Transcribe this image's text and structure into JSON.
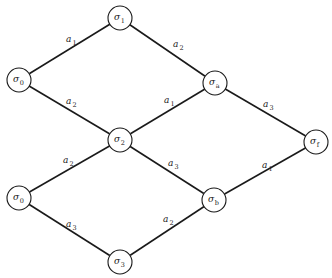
{
  "diagram": {
    "type": "state-lattice",
    "nodes": [
      {
        "id": "s1",
        "base": "σ",
        "sub": "1"
      },
      {
        "id": "s0a",
        "base": "σ",
        "sub": "0"
      },
      {
        "id": "s2",
        "base": "σ",
        "sub": "2"
      },
      {
        "id": "sa",
        "base": "σ",
        "sub": "a"
      },
      {
        "id": "sf",
        "base": "σ",
        "sub": "f"
      },
      {
        "id": "s0b",
        "base": "σ",
        "sub": "0"
      },
      {
        "id": "sb",
        "base": "σ",
        "sub": "b"
      },
      {
        "id": "s3",
        "base": "σ",
        "sub": "3"
      }
    ],
    "edges": [
      {
        "from": "s0a",
        "to": "s1",
        "base": "a",
        "sub": "1"
      },
      {
        "from": "s1",
        "to": "sa",
        "base": "a",
        "sub": "2"
      },
      {
        "from": "s0a",
        "to": "s2",
        "base": "a",
        "sub": "2"
      },
      {
        "from": "s2",
        "to": "sa",
        "base": "a",
        "sub": "1"
      },
      {
        "from": "sa",
        "to": "sf",
        "base": "a",
        "sub": "3"
      },
      {
        "from": "s0b",
        "to": "s2",
        "base": "a",
        "sub": "2"
      },
      {
        "from": "s2",
        "to": "sb",
        "base": "a",
        "sub": "3"
      },
      {
        "from": "sb",
        "to": "sf",
        "base": "a",
        "sub": "1"
      },
      {
        "from": "s0b",
        "to": "s3",
        "base": "a",
        "sub": "3"
      },
      {
        "from": "s3",
        "to": "sb",
        "base": "a",
        "sub": "2"
      }
    ]
  }
}
